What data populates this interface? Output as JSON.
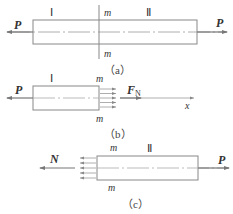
{
  "panels": {
    "a": {
      "caption": "（a）",
      "region_left": "Ⅰ",
      "region_right": "Ⅱ",
      "section_top": "m",
      "section_bottom": "m",
      "force_left": "P",
      "force_right": "P"
    },
    "b": {
      "caption": "（b）",
      "region": "Ⅰ",
      "section_top": "m",
      "section_bottom": "m",
      "force_left": "P",
      "internal_force": "F",
      "internal_force_sub": "N",
      "axis_label": "x"
    },
    "c": {
      "caption": "（c）",
      "region": "Ⅱ",
      "section_top": "m",
      "section_bottom": "m",
      "internal_force": "N",
      "force_right": "P"
    }
  },
  "colors": {
    "line": "#777777",
    "text": "#333333"
  }
}
